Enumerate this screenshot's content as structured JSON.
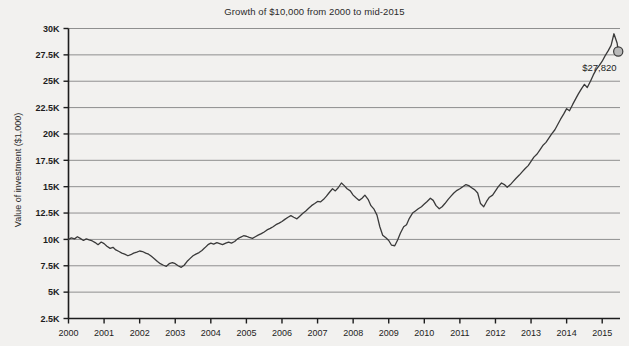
{
  "chart_data": {
    "type": "line",
    "title": "Growth of $10,000 from 2000 to mid-2015",
    "xlabel": "",
    "ylabel": "Value of investment ($1,000)",
    "xlim": [
      2000,
      2015.5
    ],
    "ylim": [
      2500,
      30000
    ],
    "grid": true,
    "legend": "none",
    "line_color": "#3a3a3a",
    "grid_color": "#8f8f8f",
    "axis_color": "#1d1d1d",
    "background_color": "#f2f1ef",
    "marker_fill_color": "#b9b9b9",
    "marker_edge_color": "#3a3a3a",
    "ytick_labels": [
      "2.5K",
      "5K",
      "7.5K",
      "10K",
      "12.5K",
      "15K",
      "17.5K",
      "20K",
      "22.5K",
      "25K",
      "27.5K",
      "30K"
    ],
    "ytick_values": [
      2500,
      5000,
      7500,
      10000,
      12500,
      15000,
      17500,
      20000,
      22500,
      25000,
      27500,
      30000
    ],
    "xtick_labels": [
      "2000",
      "2001",
      "2002",
      "2003",
      "2004",
      "2005",
      "2006",
      "2007",
      "2008",
      "2009",
      "2010",
      "2011",
      "2012",
      "2013",
      "2014",
      "2015"
    ],
    "xtick_values": [
      2000,
      2001,
      2002,
      2003,
      2004,
      2005,
      2006,
      2007,
      2008,
      2009,
      2010,
      2011,
      2012,
      2013,
      2014,
      2015
    ],
    "annotations": [
      {
        "text": "$27,820",
        "x": 2015.45,
        "y": 27820,
        "marker": true
      }
    ],
    "series": [
      {
        "name": "Value of investment",
        "x": [
          2000.0,
          2000.08,
          2000.17,
          2000.25,
          2000.33,
          2000.42,
          2000.5,
          2000.58,
          2000.67,
          2000.75,
          2000.83,
          2000.92,
          2001.0,
          2001.08,
          2001.17,
          2001.25,
          2001.33,
          2001.42,
          2001.5,
          2001.58,
          2001.67,
          2001.75,
          2001.83,
          2001.92,
          2002.0,
          2002.08,
          2002.17,
          2002.25,
          2002.33,
          2002.42,
          2002.5,
          2002.58,
          2002.67,
          2002.75,
          2002.83,
          2002.92,
          2003.0,
          2003.08,
          2003.17,
          2003.25,
          2003.33,
          2003.42,
          2003.5,
          2003.58,
          2003.67,
          2003.75,
          2003.83,
          2003.92,
          2004.0,
          2004.08,
          2004.17,
          2004.25,
          2004.33,
          2004.42,
          2004.5,
          2004.58,
          2004.67,
          2004.75,
          2004.83,
          2004.92,
          2005.0,
          2005.08,
          2005.17,
          2005.25,
          2005.33,
          2005.42,
          2005.5,
          2005.58,
          2005.67,
          2005.75,
          2005.83,
          2005.92,
          2006.0,
          2006.08,
          2006.17,
          2006.25,
          2006.33,
          2006.42,
          2006.5,
          2006.58,
          2006.67,
          2006.75,
          2006.83,
          2006.92,
          2007.0,
          2007.08,
          2007.17,
          2007.25,
          2007.33,
          2007.42,
          2007.5,
          2007.58,
          2007.67,
          2007.75,
          2007.83,
          2007.92,
          2008.0,
          2008.08,
          2008.17,
          2008.25,
          2008.33,
          2008.42,
          2008.5,
          2008.58,
          2008.67,
          2008.75,
          2008.83,
          2008.92,
          2009.0,
          2009.08,
          2009.17,
          2009.25,
          2009.33,
          2009.42,
          2009.5,
          2009.58,
          2009.67,
          2009.75,
          2009.83,
          2009.92,
          2010.0,
          2010.08,
          2010.17,
          2010.25,
          2010.33,
          2010.42,
          2010.5,
          2010.58,
          2010.67,
          2010.75,
          2010.83,
          2010.92,
          2011.0,
          2011.08,
          2011.17,
          2011.25,
          2011.33,
          2011.42,
          2011.5,
          2011.58,
          2011.67,
          2011.75,
          2011.83,
          2011.92,
          2012.0,
          2012.08,
          2012.17,
          2012.25,
          2012.33,
          2012.42,
          2012.5,
          2012.58,
          2012.67,
          2012.75,
          2012.83,
          2012.92,
          2013.0,
          2013.08,
          2013.17,
          2013.25,
          2013.33,
          2013.42,
          2013.5,
          2013.58,
          2013.67,
          2013.75,
          2013.83,
          2013.92,
          2014.0,
          2014.08,
          2014.17,
          2014.25,
          2014.33,
          2014.42,
          2014.5,
          2014.58,
          2014.67,
          2014.75,
          2014.83,
          2014.92,
          2015.0,
          2015.08,
          2015.17,
          2015.25,
          2015.33,
          2015.42,
          2015.45
        ],
        "y": [
          10000,
          10150,
          10050,
          10250,
          10100,
          9900,
          10050,
          9950,
          9850,
          9700,
          9500,
          9750,
          9600,
          9350,
          9150,
          9250,
          9000,
          8850,
          8700,
          8600,
          8450,
          8550,
          8700,
          8800,
          8900,
          8850,
          8700,
          8600,
          8400,
          8150,
          7900,
          7700,
          7550,
          7450,
          7700,
          7800,
          7700,
          7500,
          7350,
          7550,
          7900,
          8200,
          8450,
          8600,
          8750,
          8950,
          9200,
          9500,
          9650,
          9550,
          9700,
          9600,
          9500,
          9650,
          9750,
          9650,
          9800,
          10050,
          10200,
          10350,
          10300,
          10200,
          10100,
          10250,
          10400,
          10550,
          10700,
          10900,
          11050,
          11200,
          11400,
          11550,
          11700,
          11900,
          12100,
          12250,
          12100,
          11950,
          12200,
          12450,
          12700,
          12950,
          13200,
          13400,
          13600,
          13550,
          13800,
          14100,
          14450,
          14800,
          14600,
          14900,
          15350,
          15100,
          14800,
          14600,
          14200,
          13950,
          13700,
          13900,
          14200,
          13800,
          13200,
          12900,
          12300,
          11200,
          10400,
          10150,
          9900,
          9450,
          9400,
          9950,
          10600,
          11200,
          11400,
          12000,
          12500,
          12700,
          12900,
          13100,
          13350,
          13600,
          13900,
          13700,
          13200,
          12900,
          13100,
          13400,
          13800,
          14100,
          14400,
          14650,
          14800,
          15000,
          15200,
          15100,
          14900,
          14700,
          14400,
          13400,
          13100,
          13600,
          14000,
          14200,
          14600,
          15000,
          15350,
          15200,
          14950,
          15200,
          15500,
          15800,
          16100,
          16400,
          16700,
          17000,
          17400,
          17800,
          18100,
          18500,
          18900,
          19200,
          19600,
          20000,
          20400,
          20900,
          21400,
          21900,
          22400,
          22200,
          22800,
          23300,
          23800,
          24300,
          24700,
          24400,
          25000,
          25600,
          26100,
          26500,
          26900,
          27400,
          27900,
          28400,
          29500,
          28600,
          27820
        ]
      }
    ]
  }
}
